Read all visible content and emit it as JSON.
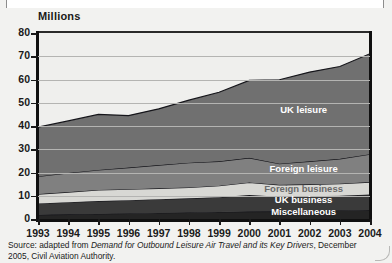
{
  "axis_title": "Millions",
  "source_prefix": "Source: adapted from ",
  "source_italic": "Demand for Outbound Leisure Air Travel and its Key Drivers",
  "source_suffix": ", December 2005, Civil Aviation Authority.",
  "colors": {
    "background": "#f2f2f0",
    "plot_background": "#efefed",
    "gridline": "#b4b4b2",
    "axis": "#101010",
    "uk_leisure": "#707070",
    "foreign_leisure": "#808080",
    "foreign_business": "#d8d8d4",
    "uk_business": "#3a3a3a",
    "miscellaneous": "#242424"
  },
  "chart_data": {
    "type": "area",
    "stacked": true,
    "title": "",
    "subtitle": "",
    "xlabel": "",
    "ylabel": "Millions",
    "ylim": [
      0,
      80
    ],
    "ytick_step": 10,
    "yticks": [
      0,
      10,
      20,
      30,
      40,
      50,
      60,
      70,
      80
    ],
    "grid": true,
    "legend_position": "inline-on-bands",
    "categories": [
      1993,
      1994,
      1995,
      1996,
      1997,
      1998,
      1999,
      2000,
      2001,
      2002,
      2003,
      2004
    ],
    "tick_labels": [
      "1993",
      "1994",
      "1995",
      "1996",
      "1997",
      "1998",
      "1999",
      "2000",
      "2001",
      "2002",
      "2003",
      "2004"
    ],
    "series": [
      {
        "name": "Miscellaneous",
        "values": [
          1.8,
          2.0,
          2.2,
          2.4,
          2.6,
          2.8,
          3.0,
          3.2,
          3.3,
          3.5,
          3.7,
          3.9
        ]
      },
      {
        "name": "UK business",
        "values": [
          4.9,
          5.2,
          5.5,
          5.7,
          5.9,
          6.1,
          6.4,
          7.1,
          6.3,
          6.3,
          6.3,
          6.6
        ]
      },
      {
        "name": "Foreign business",
        "values": [
          4.0,
          4.4,
          4.8,
          4.7,
          4.7,
          4.7,
          4.9,
          5.4,
          5.1,
          5.1,
          5.2,
          5.4
        ]
      },
      {
        "name": "Foreign leisure",
        "values": [
          7.6,
          8.2,
          8.6,
          9.3,
          10.0,
          10.6,
          10.5,
          10.6,
          9.1,
          9.9,
          10.7,
          12.0
        ]
      },
      {
        "name": "UK leisure",
        "values": [
          21.2,
          22.4,
          23.9,
          22.4,
          24.2,
          26.9,
          29.7,
          33.3,
          36.1,
          38.4,
          39.7,
          43.2
        ]
      }
    ],
    "cumulative_totals": [
      39.5,
      42.2,
      45.0,
      44.5,
      47.4,
      51.1,
      54.5,
      59.6,
      59.9,
      63.2,
      65.6,
      71.1
    ],
    "series_labels": [
      {
        "name": "UK leisure",
        "x": 2002,
        "y": 47
      },
      {
        "name": "Foreign leisure",
        "x": 2002,
        "y": 21.5
      },
      {
        "name": "Foreign business",
        "x": 2002,
        "y": 13
      },
      {
        "name": "UK business",
        "x": 2002,
        "y": 8
      },
      {
        "name": "Miscellaneous",
        "x": 2002,
        "y": 3
      }
    ]
  }
}
